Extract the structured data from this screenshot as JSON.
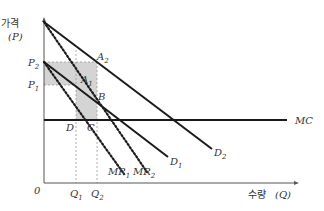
{
  "axes": {
    "y_label": "가격",
    "y_symbol": "(P)",
    "x_label": "수량",
    "x_symbol": "(Q)",
    "origin": "0"
  },
  "price_labels": [
    {
      "name": "P",
      "sub": "2"
    },
    {
      "name": "P",
      "sub": "1"
    }
  ],
  "quantity_labels": [
    {
      "name": "Q",
      "sub": "1"
    },
    {
      "name": "Q",
      "sub": "2"
    }
  ],
  "points": [
    {
      "name": "A",
      "sub": "2"
    },
    {
      "name": "A",
      "sub": "1"
    },
    {
      "name": "B",
      "sub": ""
    },
    {
      "name": "C",
      "sub": ""
    },
    {
      "name": "D",
      "sub": ""
    }
  ],
  "curves": {
    "D1": {
      "name": "D",
      "sub": "1"
    },
    "D2": {
      "name": "D",
      "sub": "2"
    },
    "MR1": {
      "name": "MR",
      "sub": "1"
    },
    "MR2": {
      "name": "MR",
      "sub": "2"
    },
    "MC": {
      "name": "MC"
    }
  },
  "colors": {
    "line": "#1a1a1a",
    "shade": "#d4d4d4",
    "guide": "#9a9a9a"
  }
}
